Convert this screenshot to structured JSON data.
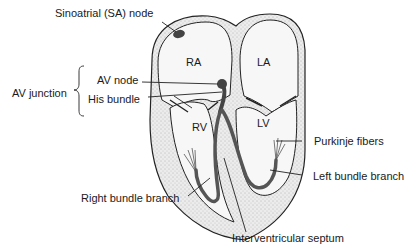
{
  "diagram": {
    "chambers": {
      "ra": "RA",
      "la": "LA",
      "rv": "RV",
      "lv": "LV"
    },
    "labels": {
      "sa_node": "Sinoatrial (SA) node",
      "av_junction": "AV junction",
      "av_node": "AV node",
      "his_bundle": "His bundle",
      "purkinje_fibers": "Purkinje fibers",
      "left_bundle_branch": "Left bundle branch",
      "right_bundle_branch": "Right bundle branch",
      "interventricular_septum": "Interventricular septum"
    },
    "colors": {
      "wall_fill": "#d9d9d9",
      "chamber_fill": "#f4f4f4",
      "conduction": "#555555",
      "outline": "#222222"
    }
  }
}
